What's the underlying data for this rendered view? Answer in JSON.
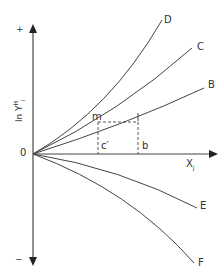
{
  "diagram": {
    "axes": {
      "y_label": "ln Y",
      "y_label_superscript": "H",
      "y_label_subscript": "i",
      "x_label": "X",
      "x_label_subscript": "j",
      "origin_label": "0",
      "y_positive_sign": "+",
      "y_negative_sign": "−"
    },
    "curves": [
      {
        "id": "D",
        "label": "D",
        "direction": "convex-upward"
      },
      {
        "id": "C",
        "label": "C",
        "direction": "upward"
      },
      {
        "id": "B",
        "label": "B",
        "direction": "upward-linear"
      },
      {
        "id": "E",
        "label": "E",
        "direction": "downward"
      },
      {
        "id": "F",
        "label": "F",
        "direction": "concave-downward"
      }
    ],
    "points": {
      "m": "m",
      "l": "l",
      "c_prime": "c′",
      "b": "b"
    },
    "colors": {
      "axis": "#333333",
      "curve": "#444444",
      "dashed": "#444444"
    }
  }
}
